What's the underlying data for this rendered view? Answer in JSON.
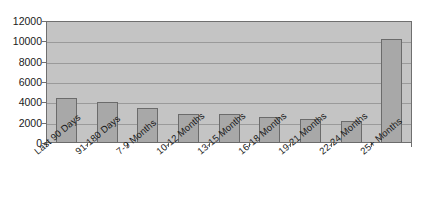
{
  "chart_data": {
    "type": "bar",
    "title": "",
    "subtitle": "",
    "xlabel": "",
    "ylabel": "",
    "categories": [
      "Last 90 Days",
      "91-180 Days",
      "7-9 Months",
      "10-12 Months",
      "13-15 Months",
      "16-18 Months",
      "19-21 Months",
      "22-24 Months",
      "25+ Months"
    ],
    "values": [
      4450,
      4000,
      3450,
      2900,
      2850,
      2550,
      2400,
      2200,
      10200
    ],
    "ylim": [
      0,
      12000
    ],
    "y_ticks": [
      0,
      2000,
      4000,
      6000,
      8000,
      10000,
      12000
    ],
    "y_tick_labels": [
      "0",
      "2000",
      "4000",
      "6000",
      "8000",
      "10000",
      "12000"
    ],
    "grid": true,
    "grid_axis": "y",
    "legend": false,
    "legend_position": "none",
    "x_tick_rotation": -40,
    "series": [
      {
        "name": "Series 1",
        "values": [
          4450,
          4000,
          3450,
          2900,
          2850,
          2550,
          2400,
          2200,
          10200
        ]
      }
    ]
  },
  "style": {
    "plot_background": "#c4c4c4",
    "page_background": "#ffffff",
    "bar_fill": "#a8a8a8",
    "bar_border": "#6b6b6b",
    "gridline_color": "#9a9a9a",
    "axis_color": "#6f6f6f",
    "text_color": "#1a1a1a"
  }
}
